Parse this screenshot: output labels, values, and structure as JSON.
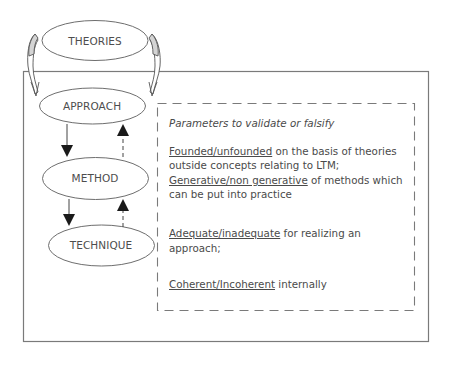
{
  "diagram": {
    "nodes": [
      {
        "id": "theories",
        "label": "THEORIES"
      },
      {
        "id": "approach",
        "label": "APPROACH"
      },
      {
        "id": "method",
        "label": "METHOD"
      },
      {
        "id": "technique",
        "label": "TECHNIQUE"
      }
    ],
    "edges": [
      {
        "from": "theories",
        "to": "approach",
        "style": "curved-arrow",
        "note": "two curved arrows descending from THEORIES into the outer frame"
      },
      {
        "from": "approach",
        "to": "method",
        "style": "solid"
      },
      {
        "from": "method",
        "to": "technique",
        "style": "solid"
      },
      {
        "from": "method",
        "to": "approach",
        "style": "dashed"
      },
      {
        "from": "technique",
        "to": "method",
        "style": "dashed"
      }
    ],
    "panel": {
      "title": "Parameters to validate or falsify",
      "items": [
        {
          "underlined": "Founded/unfounded",
          "rest": " on the basis of theories outside concepts relating to LTM;"
        },
        {
          "underlined": "Generative/non generative",
          "rest": " of methods which can be put into practice"
        },
        {
          "underlined": "Adequate/inadequate",
          "rest": " for realizing an approach;"
        },
        {
          "underlined": "Coherent/Incoherent",
          "rest": " internally"
        }
      ]
    },
    "colors": {
      "line": "#6e6e6e",
      "text": "#4a4a4a",
      "arrow_fill": "#1a1a1a",
      "curved_arrow_fill": "#d4d4d4"
    }
  }
}
